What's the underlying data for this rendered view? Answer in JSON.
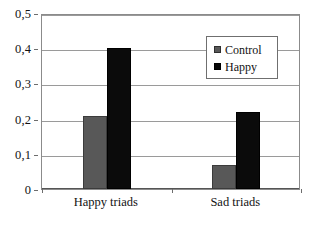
{
  "chart_data": {
    "type": "bar",
    "title": "",
    "subtitle": "",
    "xlabel": "",
    "ylabel": "",
    "categories": [
      "Happy triads",
      "Sad triads"
    ],
    "series": [
      {
        "name": "Control",
        "values": [
          0.207,
          0.068
        ],
        "color": "#585858"
      },
      {
        "name": "Happy",
        "values": [
          0.4,
          0.218
        ],
        "color": "#0b0b0b"
      }
    ],
    "ylim": [
      0,
      0.5
    ],
    "yticks": [
      0,
      0.1,
      0.2,
      0.3,
      0.4,
      0.5
    ],
    "ytick_labels": [
      "0",
      "0,1",
      "0,2",
      "0,3",
      "0,4",
      "0,5"
    ],
    "grid": "horizontal",
    "legend_position": "upper-right",
    "decimal_separator": ","
  },
  "legend": {
    "entries": [
      {
        "label": "Control",
        "swatch": "gray-square-swatch"
      },
      {
        "label": "Happy",
        "swatch": "black-square-swatch"
      }
    ]
  },
  "axes": {
    "y_labels": [
      "0,5",
      "0,4",
      "0,3",
      "0,2",
      "0,1",
      "0"
    ],
    "x_labels": [
      "Happy triads",
      "Sad triads"
    ]
  }
}
